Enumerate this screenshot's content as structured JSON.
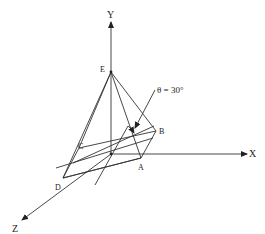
{
  "diagram": {
    "axes": {
      "x_label": "X",
      "y_label": "Y",
      "z_label": "Z"
    },
    "points": {
      "E": "E",
      "A": "A",
      "B": "B",
      "C": "C",
      "D": "D"
    },
    "angle_annotation": "θ = 30°",
    "colors": {
      "line": "#333333",
      "text": "#222222",
      "background": "#ffffff"
    }
  }
}
